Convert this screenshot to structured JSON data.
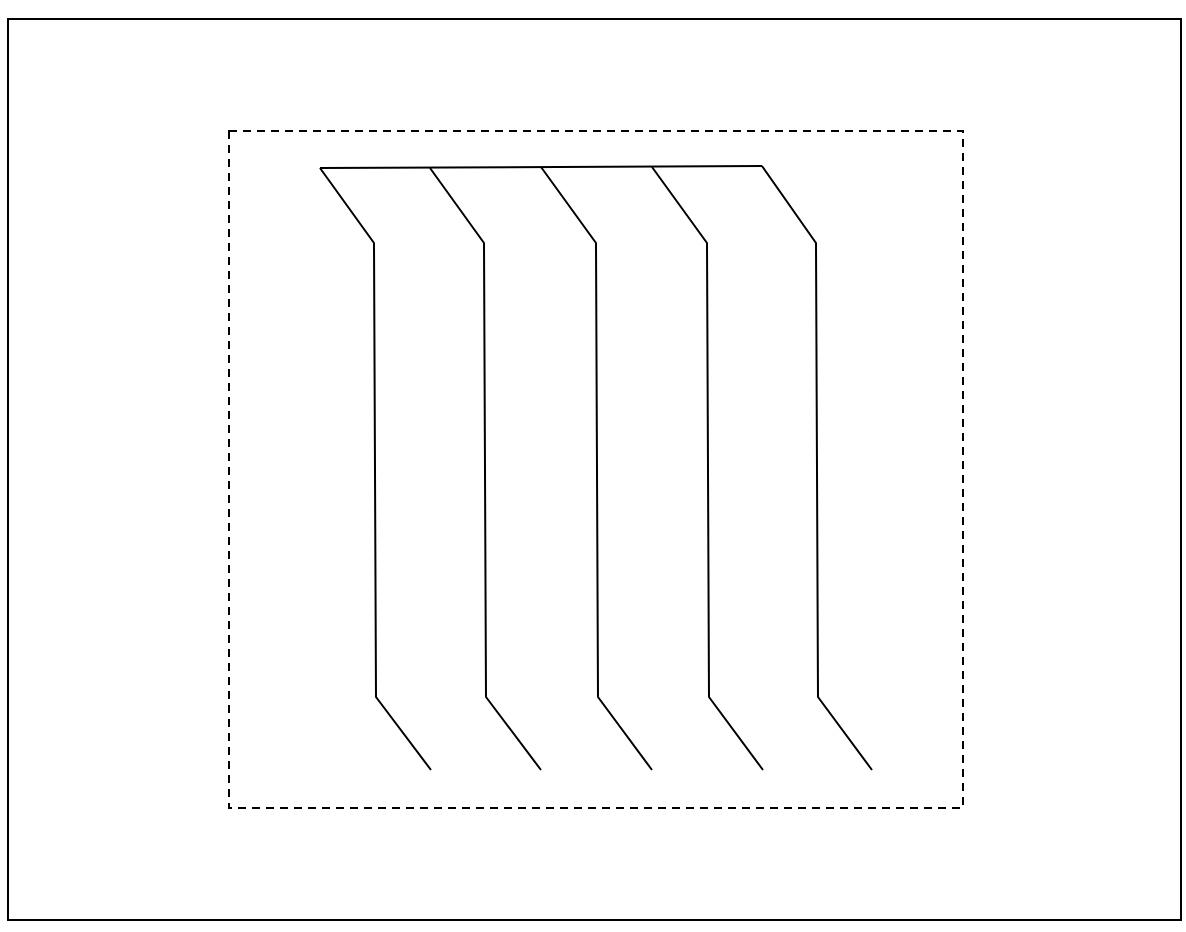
{
  "diagram": {
    "background": "#ffffff",
    "stroke_color": "#000000",
    "outer_frame": {
      "x1": 8,
      "y1": 19,
      "x2": 1181,
      "y2": 920,
      "stroke_width": 2
    },
    "dashed_box": {
      "x1": 229,
      "y1": 131,
      "x2": 963,
      "y2": 808,
      "stroke_width": 2,
      "dash": "8,6"
    },
    "top_bar": {
      "x1": 320,
      "y1": 168,
      "x2": 762,
      "y2": 166,
      "stroke_width": 2
    },
    "strands": [
      {
        "points": [
          [
            320,
            168
          ],
          [
            374,
            243
          ],
          [
            376,
            697
          ],
          [
            431,
            770
          ]
        ]
      },
      {
        "points": [
          [
            430,
            168
          ],
          [
            484,
            243
          ],
          [
            486,
            697
          ],
          [
            541,
            770
          ]
        ]
      },
      {
        "points": [
          [
            541,
            167
          ],
          [
            596,
            243
          ],
          [
            598,
            697
          ],
          [
            652,
            770
          ]
        ]
      },
      {
        "points": [
          [
            652,
            167
          ],
          [
            707,
            243
          ],
          [
            709,
            697
          ],
          [
            763,
            770
          ]
        ]
      },
      {
        "points": [
          [
            762,
            166
          ],
          [
            816,
            243
          ],
          [
            818,
            697
          ],
          [
            872,
            770
          ]
        ]
      }
    ],
    "strand_stroke_width": 2
  }
}
